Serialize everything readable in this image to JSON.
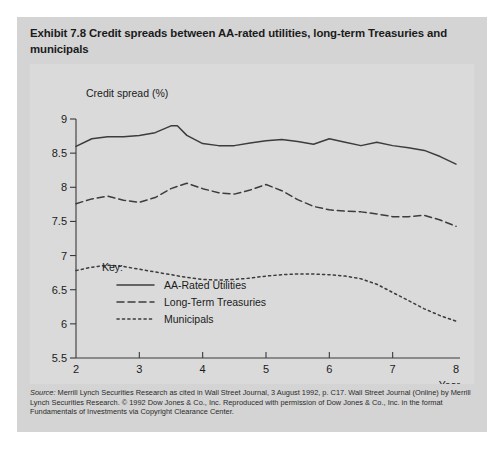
{
  "exhibit": {
    "title": "Exhibit 7.8  Credit spreads between AA-rated utilities, long-term Treasuries and municipals",
    "source_note_line1_prefix": "Source:",
    "source_note": " Merrill Lynch Securities Research as cited in Wall Street Journal, 3 August 1992, p. C17. Wall Street Journal (Online) by Merrill Lynch Securities Research. © 1992 Dow Jones & Co., Inc. Reproduced with permission of Dow Jones & Co., Inc. in the format Fundamentals of Investments via Copyright Clearance Center."
  },
  "chart_data": {
    "type": "line",
    "title": "Credit spreads between AA-rated utilities, long-term Treasuries and municipals",
    "ylabel": "Credit spread (%)",
    "xlabel": "Year",
    "xlim": [
      2,
      8
    ],
    "ylim": [
      5.5,
      9
    ],
    "xticks": [
      "2",
      "3",
      "4",
      "5",
      "6",
      "7",
      "8"
    ],
    "yticks": [
      "5.5",
      "6",
      "6.5",
      "7",
      "7.5",
      "8",
      "8.5",
      "9"
    ],
    "grid": false,
    "legend_position": "inside-lower-left",
    "legend_title": "Key:",
    "series": [
      {
        "name": "AA-Rated Utilities",
        "style": "solid",
        "x": [
          2.0,
          2.25,
          2.5,
          2.75,
          3.0,
          3.25,
          3.5,
          3.6,
          3.75,
          4.0,
          4.25,
          4.5,
          4.75,
          5.0,
          5.25,
          5.5,
          5.75,
          6.0,
          6.25,
          6.5,
          6.75,
          7.0,
          7.25,
          7.5,
          7.75,
          8.0
        ],
        "values": [
          8.6,
          8.71,
          8.74,
          8.74,
          8.76,
          8.8,
          8.9,
          8.9,
          8.76,
          8.64,
          8.61,
          8.61,
          8.65,
          8.68,
          8.7,
          8.67,
          8.63,
          8.71,
          8.66,
          8.61,
          8.66,
          8.61,
          8.58,
          8.54,
          8.45,
          8.34
        ]
      },
      {
        "name": "Long-Term Treasuries",
        "style": "dashed",
        "x": [
          2.0,
          2.25,
          2.5,
          2.75,
          3.0,
          3.25,
          3.5,
          3.75,
          4.0,
          4.25,
          4.5,
          4.75,
          5.0,
          5.25,
          5.5,
          5.75,
          6.0,
          6.25,
          6.5,
          6.75,
          7.0,
          7.25,
          7.5,
          7.75,
          8.0
        ],
        "values": [
          7.76,
          7.83,
          7.87,
          7.81,
          7.78,
          7.85,
          7.98,
          8.06,
          7.98,
          7.92,
          7.9,
          7.96,
          8.04,
          7.95,
          7.82,
          7.72,
          7.67,
          7.65,
          7.64,
          7.61,
          7.57,
          7.57,
          7.59,
          7.52,
          7.43
        ]
      },
      {
        "name": "Municipals",
        "style": "dotted",
        "x": [
          2.0,
          2.25,
          2.5,
          2.75,
          3.0,
          3.25,
          3.5,
          3.75,
          4.0,
          4.25,
          4.5,
          4.75,
          5.0,
          5.25,
          5.5,
          5.75,
          6.0,
          6.25,
          6.5,
          6.75,
          7.0,
          7.25,
          7.5,
          7.75,
          8.0
        ],
        "values": [
          6.78,
          6.83,
          6.86,
          6.84,
          6.8,
          6.76,
          6.72,
          6.68,
          6.65,
          6.64,
          6.65,
          6.67,
          6.7,
          6.72,
          6.73,
          6.73,
          6.72,
          6.7,
          6.66,
          6.58,
          6.46,
          6.34,
          6.22,
          6.12,
          6.04
        ]
      }
    ]
  }
}
